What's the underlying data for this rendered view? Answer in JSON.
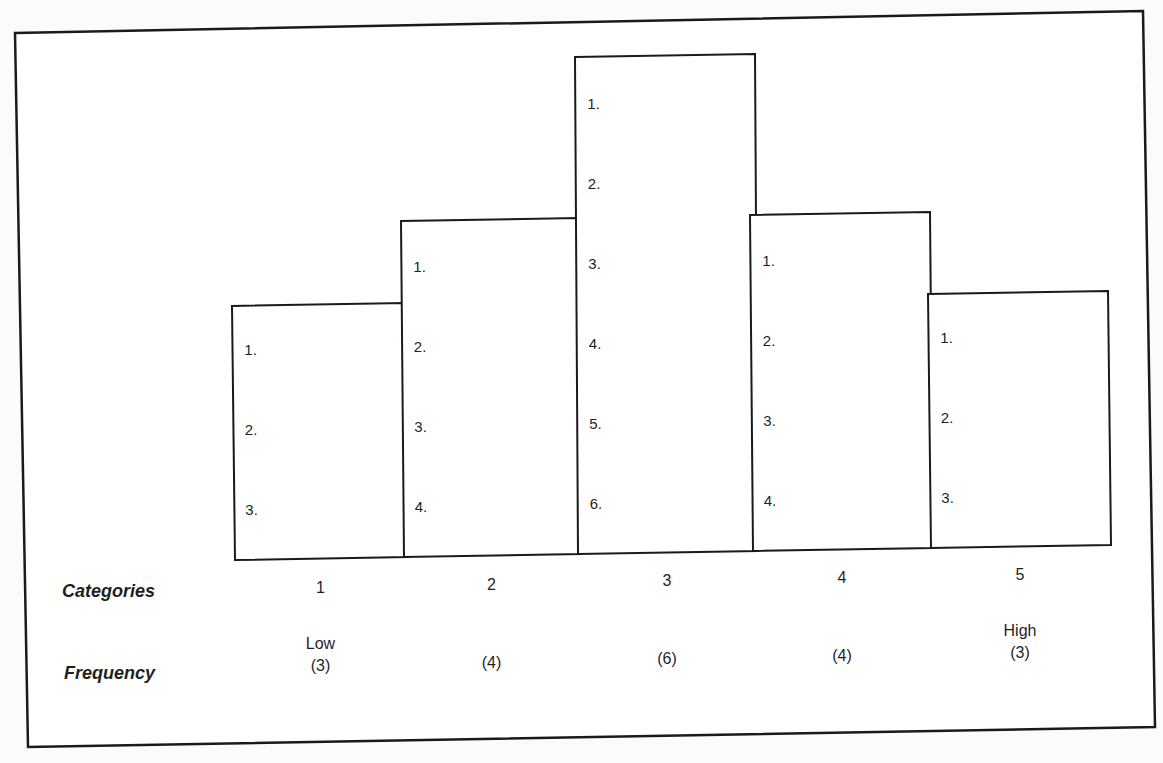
{
  "chart_data": {
    "type": "bar",
    "title": "",
    "xlabel": "Categories",
    "ylabel": "Frequency",
    "categories": [
      "1",
      "2",
      "3",
      "4",
      "5"
    ],
    "values": [
      3,
      4,
      6,
      4,
      3
    ],
    "category_annotations": [
      "Low",
      "",
      "",
      "",
      "High"
    ],
    "frequency_labels": [
      "(3)",
      "(4)",
      "(6)",
      "(4)",
      "(3)"
    ],
    "bar_item_labels": [
      [
        "1.",
        "2.",
        "3."
      ],
      [
        "1.",
        "2.",
        "3.",
        "4."
      ],
      [
        "1.",
        "2.",
        "3.",
        "4.",
        "5.",
        "6."
      ],
      [
        "1.",
        "2.",
        "3.",
        "4."
      ],
      [
        "1.",
        "2.",
        "3."
      ]
    ],
    "ylim": [
      0,
      6
    ],
    "grid": false,
    "legend": null,
    "bar_fill": "#ffffff",
    "bar_stroke": "#1a1a1a"
  },
  "row_labels": {
    "categories": "Categories",
    "frequency": "Frequency"
  }
}
